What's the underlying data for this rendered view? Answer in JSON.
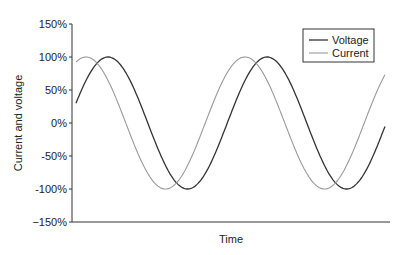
{
  "chart_data": {
    "type": "line",
    "title": "",
    "xlabel": "Time",
    "ylabel": "Current and voltage",
    "ylim": [
      -150,
      150
    ],
    "yticks": [
      150,
      100,
      50,
      0,
      -50,
      -100,
      -150
    ],
    "ytick_labels": [
      "150%",
      "100%",
      "50%",
      "0%",
      "-50%",
      "-100%",
      "−150%"
    ],
    "grid": false,
    "legend_position": "upper right",
    "x_range_px_periods": 1.95,
    "series": [
      {
        "name": "Voltage",
        "color": "#333333",
        "amplitude": 100,
        "phase_deg": 0,
        "start_value": 30,
        "end_value": -5
      },
      {
        "name": "Current",
        "color": "#999999",
        "amplitude": 100,
        "phase_deg": 50,
        "start_value": 95,
        "end_value": 75
      }
    ]
  },
  "legend": {
    "items": [
      {
        "label": "Voltage",
        "color": "#333333"
      },
      {
        "label": "Current",
        "color": "#999999"
      }
    ]
  }
}
